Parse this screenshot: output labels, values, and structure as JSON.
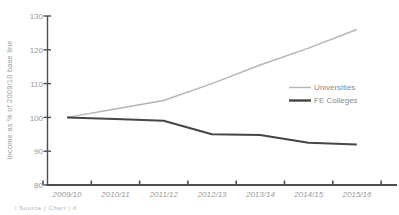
{
  "chart_data": {
    "type": "line",
    "title": "",
    "xlabel": "",
    "ylabel": "Income as % of 2009/10 base line",
    "categories": [
      "2009/10",
      "2010/11",
      "2011/12",
      "2012/13",
      "2013/14",
      "2014/15",
      "2015/16"
    ],
    "y_tick_labels_top_to_bottom": [
      "130",
      "120",
      "110",
      "100",
      "90",
      "80"
    ],
    "y_ticks": [
      80,
      90,
      100,
      110,
      120,
      130
    ],
    "ylim": [
      80,
      130
    ],
    "grid": false,
    "legend_position": "middle-right",
    "axis_color": "#4d4d4d",
    "tick_label_color": "#9a9a9a",
    "series": [
      {
        "name": "Universities",
        "color": "#b5b5b5",
        "stroke_width": 1.4,
        "values": [
          100,
          102.5,
          105,
          110,
          115.5,
          120.5,
          126
        ]
      },
      {
        "name": "FE Colleges",
        "color": "#454545",
        "stroke_width": 2,
        "values": [
          100,
          99.5,
          99,
          95,
          94.8,
          92.5,
          92
        ]
      }
    ]
  },
  "footer": {
    "clipped_caption": "i   Source   |  Chart  |   d"
  }
}
